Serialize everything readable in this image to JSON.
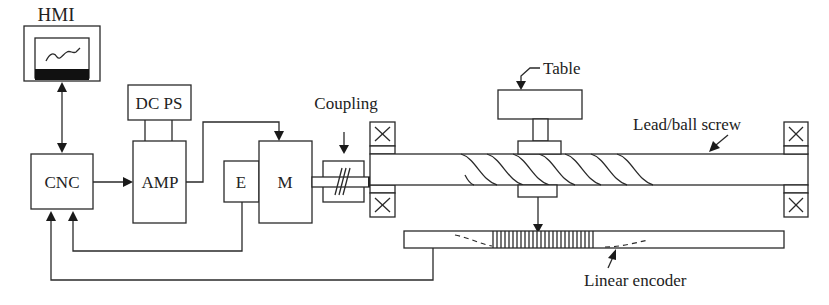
{
  "diagram": {
    "components": {
      "hmi": {
        "label": "HMI"
      },
      "cnc": {
        "label": "CNC"
      },
      "amp": {
        "label": "AMP"
      },
      "dcps": {
        "label": "DC PS"
      },
      "encoder": {
        "label": "E"
      },
      "motor": {
        "label": "M"
      },
      "coupling": {
        "label": "Coupling"
      },
      "table": {
        "label": "Table"
      },
      "screw": {
        "label": "Lead/ball screw"
      },
      "linear_encoder": {
        "label": "Linear encoder"
      }
    },
    "colors": {
      "line": "#2a2a2a",
      "background": "#ffffff"
    }
  }
}
